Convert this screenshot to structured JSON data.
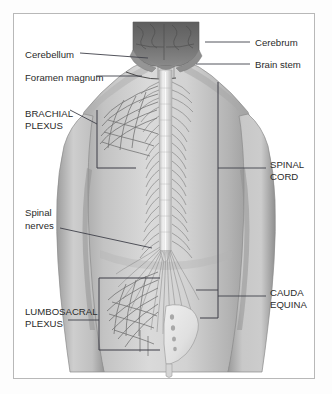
{
  "figure": {
    "frame_color": "#b8b8b8",
    "background_color": "#fdfdfd",
    "ink_color": "#2b2b2b",
    "leader_color": "#40414a"
  },
  "labels": {
    "cerebellum": "Cerebellum",
    "foramen_magnum": "Foramen magnum",
    "cerebrum": "Cerebrum",
    "brain_stem": "Brain stem",
    "brachial_plexus_line1": "BRACHIAL",
    "brachial_plexus_line2": "PLEXUS",
    "spinal_cord_line1": "SPINAL",
    "spinal_cord_line2": "CORD",
    "spinal_nerves_line1": "Spinal",
    "spinal_nerves_line2": "nerves",
    "lumbosacral_plexus_line1": "LUMBOSACRAL",
    "lumbosacral_plexus_line2": "PLEXUS",
    "cauda_equina_line1": "CAUDA",
    "cauda_equina_line2": "EQUINA"
  },
  "anatomy": {
    "body_fill": "#c6c6c6",
    "body_shadow": "#9a9a9a",
    "body_highlight": "#dcdcdc",
    "cerebrum_fill": "#6d6d6d",
    "cerebellum_fill": "#8f8f8f",
    "cord_fill": "#e2e2e2",
    "nerve_stroke": "#7d7d7d",
    "sacrum_fill": "#e6e6e6"
  }
}
